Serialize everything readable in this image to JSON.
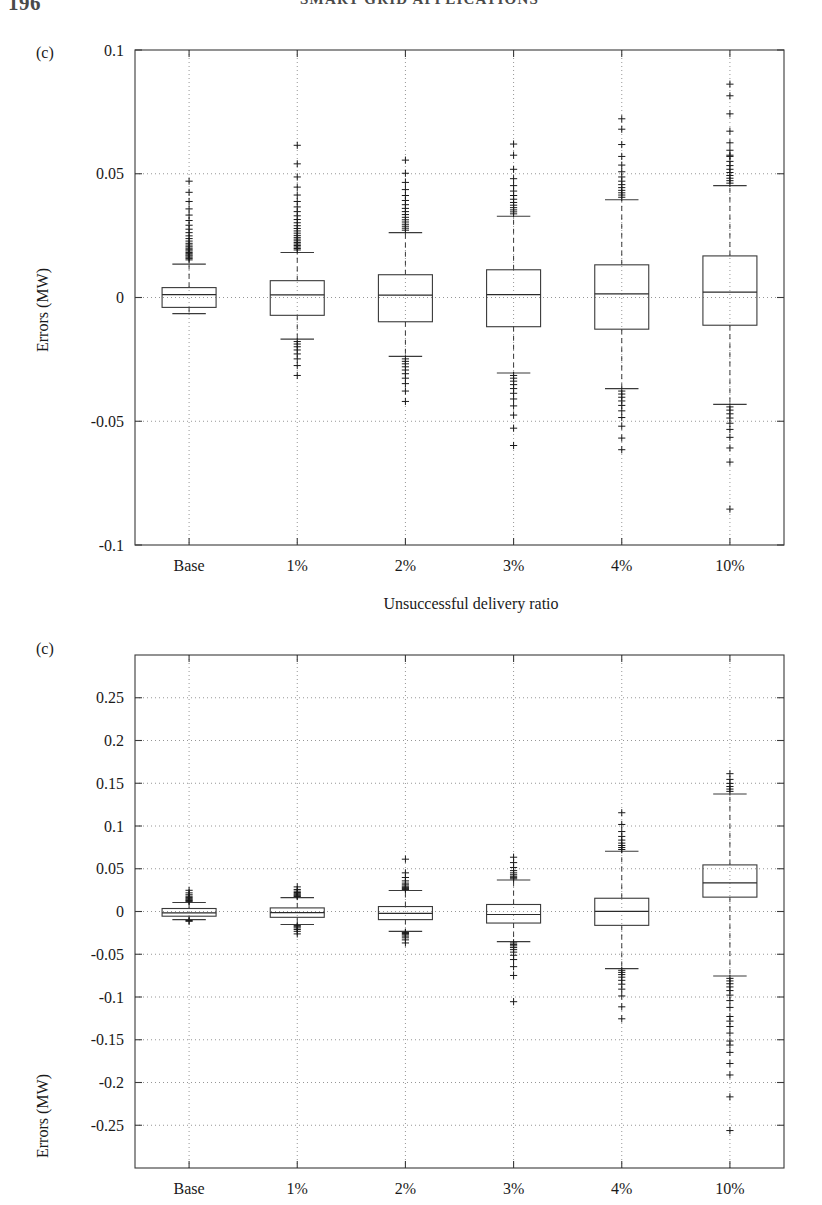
{
  "header": {
    "folio": "196",
    "running_head": "SMART GRID APPLICATIONS"
  },
  "chart_data": [
    {
      "id": "figure-1",
      "type": "box",
      "panel_label": "(c)",
      "title": "",
      "xlabel": "Unsuccessful delivery ratio",
      "ylabel": "Errors (MW)",
      "categories": [
        "Base",
        "1%",
        "2%",
        "3%",
        "4%",
        "10%"
      ],
      "ylim": [
        -0.1,
        0.1
      ],
      "yticks": [
        0.1,
        0.05,
        0,
        -0.05,
        -0.1
      ],
      "ytick_labels": [
        "0.1",
        "0.05",
        "0",
        "-0.05",
        "-0.1"
      ],
      "grid": "dotted",
      "legend": "none",
      "boxes": [
        {
          "category": "Base",
          "q1": -0.004,
          "median": 0.0012,
          "q3": 0.004,
          "whisker_low": -0.0065,
          "whisker_high": 0.0135,
          "outliers_high": [
            0.0152,
            0.0158,
            0.0163,
            0.0168,
            0.0172,
            0.0177,
            0.0182,
            0.0188,
            0.0193,
            0.0199,
            0.0205,
            0.0212,
            0.0219,
            0.0228,
            0.0238,
            0.0249,
            0.0262,
            0.0276,
            0.0292,
            0.0311,
            0.0333,
            0.0358,
            0.0388,
            0.0425,
            0.047
          ],
          "outliers_low": []
        },
        {
          "category": "1%",
          "q1": -0.0072,
          "median": 0.0011,
          "q3": 0.0068,
          "whisker_low": -0.0168,
          "whisker_high": 0.0182,
          "outliers_high": [
            0.0192,
            0.0198,
            0.0204,
            0.021,
            0.0216,
            0.0222,
            0.0229,
            0.0236,
            0.0243,
            0.0251,
            0.026,
            0.0269,
            0.0279,
            0.029,
            0.0302,
            0.0315,
            0.033,
            0.0347,
            0.0366,
            0.0388,
            0.0414,
            0.0446,
            0.0487,
            0.054,
            0.0615
          ],
          "outliers_low": [
            -0.0178,
            -0.0188,
            -0.0199,
            -0.0212,
            -0.0228,
            -0.0248,
            -0.0275,
            -0.0315
          ]
        },
        {
          "category": "2%",
          "q1": -0.0098,
          "median": 0.001,
          "q3": 0.0092,
          "whisker_low": -0.0238,
          "whisker_high": 0.0262,
          "outliers_high": [
            0.0272,
            0.028,
            0.0288,
            0.0296,
            0.0305,
            0.0314,
            0.0324,
            0.0335,
            0.0347,
            0.036,
            0.0375,
            0.0392,
            0.0412,
            0.0436,
            0.0465,
            0.0502,
            0.0555
          ],
          "outliers_low": [
            -0.0248,
            -0.0258,
            -0.0268,
            -0.028,
            -0.0293,
            -0.0308,
            -0.0326,
            -0.0348,
            -0.0378,
            -0.042
          ]
        },
        {
          "category": "3%",
          "q1": -0.0118,
          "median": 0.0012,
          "q3": 0.0112,
          "whisker_low": -0.0305,
          "whisker_high": 0.0328,
          "outliers_high": [
            0.0338,
            0.0346,
            0.0354,
            0.0363,
            0.0373,
            0.0384,
            0.0397,
            0.0412,
            0.043,
            0.0452,
            0.048,
            0.0518,
            0.0575,
            0.062
          ],
          "outliers_low": [
            -0.0315,
            -0.0326,
            -0.0338,
            -0.0352,
            -0.0368,
            -0.0387,
            -0.041,
            -0.0438,
            -0.0475,
            -0.0528,
            -0.0598
          ]
        },
        {
          "category": "4%",
          "q1": -0.0128,
          "median": 0.0015,
          "q3": 0.0132,
          "whisker_low": -0.0368,
          "whisker_high": 0.0395,
          "outliers_high": [
            0.0405,
            0.0414,
            0.0423,
            0.0433,
            0.0444,
            0.0456,
            0.047,
            0.0487,
            0.0508,
            0.0535,
            0.057,
            0.0618,
            0.068,
            0.0722
          ],
          "outliers_low": [
            -0.0378,
            -0.039,
            -0.0403,
            -0.0418,
            -0.0436,
            -0.0458,
            -0.0485,
            -0.052,
            -0.0568,
            -0.0615
          ]
        },
        {
          "category": "10%",
          "q1": -0.0112,
          "median": 0.0022,
          "q3": 0.0168,
          "whisker_low": -0.0432,
          "whisker_high": 0.0452,
          "outliers_high": [
            0.0462,
            0.0472,
            0.0482,
            0.0493,
            0.0505,
            0.0518,
            0.0533,
            0.055,
            0.057,
            0.0575,
            0.0595,
            0.0625,
            0.0672,
            0.0742,
            0.0815,
            0.0862
          ],
          "outliers_low": [
            -0.0442,
            -0.0455,
            -0.047,
            -0.0487,
            -0.0508,
            -0.0533,
            -0.0565,
            -0.0608,
            -0.0665,
            -0.0855
          ]
        }
      ]
    },
    {
      "id": "figure-2",
      "type": "box",
      "panel_label": "(c)",
      "title": "",
      "xlabel": "",
      "ylabel": "Errors (MW)",
      "categories": [
        "Base",
        "1%",
        "2%",
        "3%",
        "4%",
        "10%"
      ],
      "ylim": [
        -0.3,
        0.3
      ],
      "yticks": [
        0.25,
        0.2,
        0.15,
        0.1,
        0.05,
        0,
        -0.05,
        -0.1,
        -0.15,
        -0.2,
        -0.25
      ],
      "ytick_labels": [
        "0.25",
        "0.2",
        "0.15",
        "0.1",
        "0.05",
        "0",
        "-0.05",
        "-0.1",
        "-0.15",
        "-0.2",
        "-0.25"
      ],
      "grid": "dotted",
      "legend": "none",
      "boxes": [
        {
          "category": "Base",
          "q1": -0.0055,
          "median": -0.0015,
          "q3": 0.0035,
          "whisker_low": -0.0095,
          "whisker_high": 0.0105,
          "outliers_high": [
            0.0118,
            0.0128,
            0.0138,
            0.015,
            0.0163,
            0.0178,
            0.0196,
            0.0218,
            0.0248
          ],
          "outliers_low": [
            -0.0105,
            -0.0115
          ]
        },
        {
          "category": "1%",
          "q1": -0.0068,
          "median": -0.0012,
          "q3": 0.0042,
          "whisker_low": -0.0152,
          "whisker_high": 0.0162,
          "outliers_high": [
            0.0175,
            0.0185,
            0.0196,
            0.0208,
            0.0222,
            0.0238,
            0.0258,
            0.0288
          ],
          "outliers_low": [
            -0.0165,
            -0.0178,
            -0.0192,
            -0.021,
            -0.0232,
            -0.0262
          ]
        },
        {
          "category": "2%",
          "q1": -0.0095,
          "median": -0.0022,
          "q3": 0.0058,
          "whisker_low": -0.0232,
          "whisker_high": 0.0245,
          "outliers_high": [
            0.0258,
            0.027,
            0.0282,
            0.0296,
            0.0312,
            0.0332,
            0.0358,
            0.0398,
            0.0452,
            0.0612
          ],
          "outliers_low": [
            -0.0245,
            -0.0258,
            -0.0272,
            -0.0288,
            -0.0308,
            -0.0332,
            -0.0368
          ]
        },
        {
          "category": "3%",
          "q1": -0.0135,
          "median": -0.0035,
          "q3": 0.0082,
          "whisker_low": -0.0352,
          "whisker_high": 0.0368,
          "outliers_high": [
            0.0382,
            0.0396,
            0.0412,
            0.043,
            0.0452,
            0.0478,
            0.0515,
            0.0572,
            0.0635
          ],
          "outliers_low": [
            -0.0368,
            -0.0385,
            -0.0402,
            -0.0422,
            -0.0446,
            -0.0475,
            -0.0512,
            -0.0562,
            -0.0645,
            -0.0748,
            -0.1055
          ]
        },
        {
          "category": "4%",
          "q1": -0.0162,
          "median": 0.0002,
          "q3": 0.0155,
          "whisker_low": -0.0668,
          "whisker_high": 0.0705,
          "outliers_high": [
            0.0725,
            0.0748,
            0.0772,
            0.08,
            0.0835,
            0.0878,
            0.0935,
            0.1018,
            0.1155
          ],
          "outliers_low": [
            -0.0688,
            -0.0712,
            -0.0738,
            -0.0768,
            -0.0805,
            -0.085,
            -0.0908,
            -0.0988,
            -0.1115,
            -0.1255
          ]
        },
        {
          "category": "10%",
          "q1": 0.0168,
          "median": 0.0335,
          "q3": 0.0545,
          "whisker_low": -0.0755,
          "whisker_high": 0.1375,
          "outliers_high": [
            0.1405,
            0.1432,
            0.1462,
            0.1498,
            0.1545,
            0.1612
          ],
          "outliers_low": [
            -0.0782,
            -0.0812,
            -0.0845,
            -0.0882,
            -0.0925,
            -0.0978,
            -0.1042,
            -0.1122,
            -0.1228,
            -0.1282,
            -0.1345,
            -0.1422,
            -0.1515,
            -0.1562,
            -0.1648,
            -0.1778,
            -0.1912,
            -0.2168,
            -0.2562
          ]
        }
      ]
    }
  ]
}
